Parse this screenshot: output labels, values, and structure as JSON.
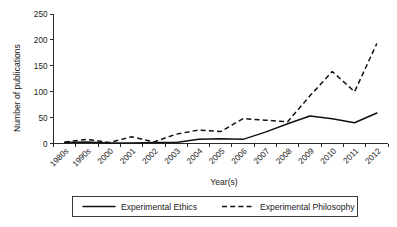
{
  "chart_data": {
    "type": "line",
    "title": "",
    "xlabel": "Year(s)",
    "ylabel": "Number of publications",
    "categories": [
      "1980s",
      "1990s",
      "2000",
      "2001",
      "2002",
      "2003",
      "2004",
      "2005",
      "2006",
      "2007",
      "2008",
      "2009",
      "2010",
      "2011",
      "2012"
    ],
    "yticks": [
      0,
      50,
      100,
      150,
      200,
      250
    ],
    "ylim": [
      0,
      250
    ],
    "grid": false,
    "legend_position": "bottom",
    "series": [
      {
        "name": "Experimental Ethics",
        "style": "solid",
        "color": "#111111",
        "values": [
          2,
          3,
          1,
          1,
          2,
          2,
          8,
          9,
          8,
          22,
          38,
          53,
          48,
          40,
          59
        ]
      },
      {
        "name": "Experimental Philosophy",
        "style": "dashed",
        "color": "#111111",
        "values": [
          3,
          8,
          2,
          13,
          3,
          18,
          26,
          23,
          48,
          45,
          42,
          92,
          139,
          100,
          193
        ]
      }
    ]
  },
  "axes": {
    "y_title": "Number of publications",
    "x_title": "Year(s)",
    "y_tick_labels": [
      "0",
      "50",
      "100",
      "150",
      "200",
      "250"
    ],
    "x_tick_labels": [
      "1980s",
      "1990s",
      "2000",
      "2001",
      "2002",
      "2003",
      "2004",
      "2005",
      "2006",
      "2007",
      "2008",
      "2009",
      "2010",
      "2011",
      "2012"
    ]
  },
  "legend": {
    "entries": [
      {
        "label": "Experimental Ethics",
        "style": "solid"
      },
      {
        "label": "Experimental Philosophy",
        "style": "dashed"
      }
    ]
  }
}
